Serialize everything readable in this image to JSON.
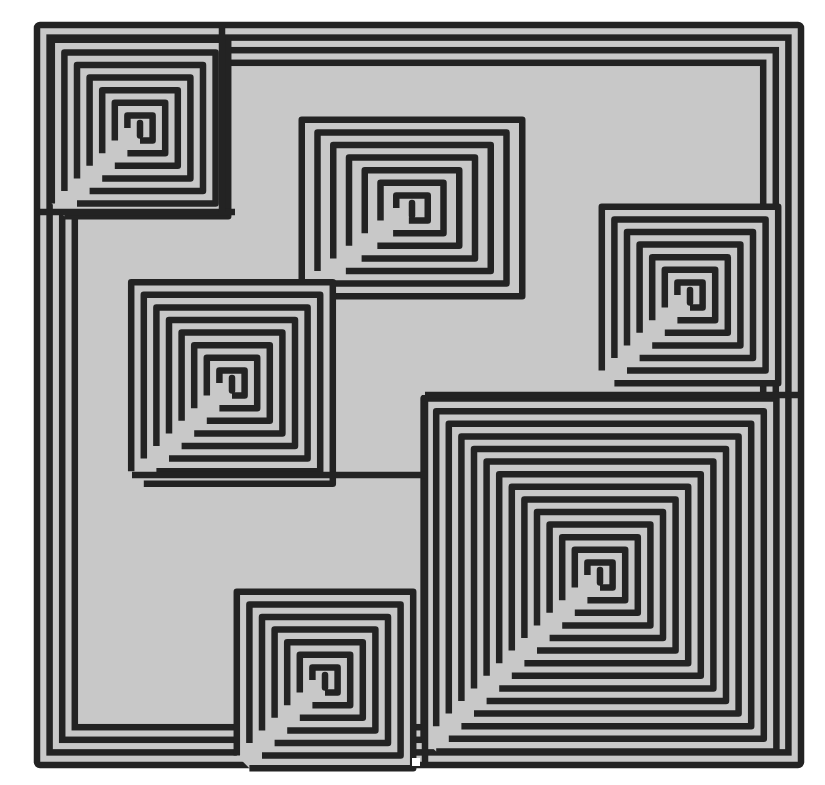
{
  "image": {
    "description": "Square maze composed of interlocking rectangular spirals",
    "colors": {
      "line": "#232323",
      "path": "#c8c8c8",
      "background": "#ffffff"
    },
    "frame": {
      "x": 37,
      "y": 25,
      "w": 764,
      "h": 740
    },
    "pitch": 12.6,
    "stroke": 6.5,
    "entrance_gap": {
      "x": 412,
      "y": 758,
      "w": 8,
      "h": 8
    },
    "spirals": [
      {
        "name": "spiral-top-left",
        "cx": 140,
        "cy": 128,
        "rings": 7
      },
      {
        "name": "spiral-top-center",
        "cx": 412,
        "cy": 208,
        "rings": 7,
        "stretch_x": 1.25
      },
      {
        "name": "spiral-right",
        "cx": 690,
        "cy": 295,
        "rings": 7
      },
      {
        "name": "spiral-middle-left",
        "cx": 232,
        "cy": 383,
        "rings": 8
      },
      {
        "name": "spiral-bottom-right",
        "cx": 600,
        "cy": 575,
        "rings": 14
      },
      {
        "name": "spiral-bottom-center",
        "cx": 325,
        "cy": 680,
        "rings": 7
      }
    ],
    "corridors": [
      {
        "x1": 37,
        "y1": 212,
        "x2": 235,
        "y2": 212
      },
      {
        "x1": 222,
        "y1": 25,
        "x2": 222,
        "y2": 212
      },
      {
        "x1": 425,
        "y1": 395,
        "x2": 801,
        "y2": 395
      },
      {
        "x1": 425,
        "y1": 395,
        "x2": 425,
        "y2": 765
      },
      {
        "x1": 132,
        "y1": 475,
        "x2": 425,
        "y2": 475
      }
    ]
  }
}
